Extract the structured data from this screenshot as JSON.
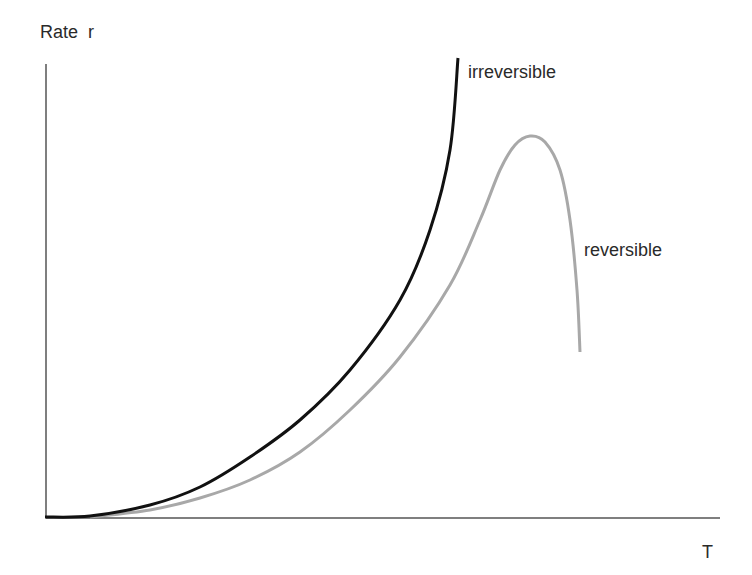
{
  "chart_data": {
    "type": "line",
    "title": "",
    "xlabel": "T",
    "ylabel": "Rate  r",
    "grid": false,
    "ticks": "none",
    "series": [
      {
        "name": "irreversible",
        "color": "#111111",
        "description": "Monotonically increasing, exponential-like rise with temperature",
        "points_px": [
          [
            45,
            517
          ],
          [
            90,
            516
          ],
          [
            150,
            505
          ],
          [
            200,
            487
          ],
          [
            250,
            457
          ],
          [
            300,
            420
          ],
          [
            350,
            370
          ],
          [
            400,
            300
          ],
          [
            430,
            230
          ],
          [
            450,
            150
          ],
          [
            458,
            58
          ]
        ]
      },
      {
        "name": "reversible",
        "color": "#a8a8a8",
        "description": "Rises with temperature, reaches a maximum, then falls sharply",
        "points_px": [
          [
            90,
            517
          ],
          [
            150,
            510
          ],
          [
            200,
            498
          ],
          [
            250,
            480
          ],
          [
            300,
            452
          ],
          [
            350,
            410
          ],
          [
            400,
            357
          ],
          [
            450,
            285
          ],
          [
            480,
            220
          ],
          [
            500,
            170
          ],
          [
            515,
            145
          ],
          [
            530,
            136
          ],
          [
            545,
            142
          ],
          [
            560,
            170
          ],
          [
            570,
            220
          ],
          [
            577,
            290
          ],
          [
            580,
            352
          ]
        ]
      }
    ],
    "annotations": [
      {
        "text": "irreversible",
        "near": "top of irreversible curve"
      },
      {
        "text": "reversible",
        "near": "descending branch of reversible curve"
      }
    ]
  },
  "labels": {
    "y_axis": "Rate  r",
    "x_axis": "T",
    "irreversible": "irreversible",
    "reversible": "reversible"
  }
}
